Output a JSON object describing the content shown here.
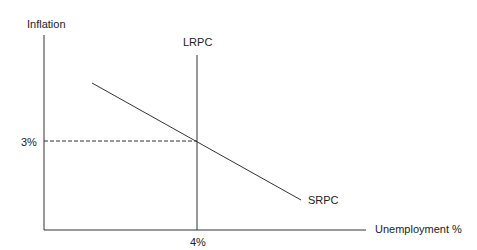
{
  "diagram": {
    "y_axis_label": "Inflation",
    "x_axis_label": "Unemployment %",
    "curves": [
      {
        "name": "LRPC",
        "type": "vertical",
        "x_value": "4%"
      },
      {
        "name": "SRPC",
        "type": "downward-sloping"
      }
    ],
    "equilibrium": {
      "inflation": "3%",
      "unemployment": "4%"
    },
    "y_tick_label": "3%",
    "x_tick_label": "4%"
  }
}
